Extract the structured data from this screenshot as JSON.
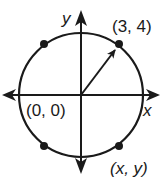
{
  "diagram": {
    "type": "circle-on-coordinate-plane",
    "axes": {
      "x_label": "x",
      "y_label": "y"
    },
    "origin_label": "(0, 0)",
    "points": [
      {
        "id": "p1",
        "label": "(3, 4)",
        "quadrant": "I"
      },
      {
        "id": "p2",
        "label": "",
        "quadrant": "II"
      },
      {
        "id": "p3",
        "label": "",
        "quadrant": "III"
      },
      {
        "id": "p4",
        "label": "(x, y)",
        "quadrant": "IV"
      }
    ],
    "radius_arrow": "from (0, 0) to (3, 4)",
    "colors": {
      "ink": "#1a1a1a",
      "background": "#ffffff"
    }
  }
}
